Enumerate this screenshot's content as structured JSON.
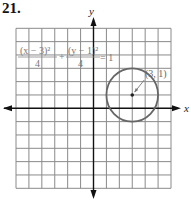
{
  "problem_number": "21.",
  "chart_data": {
    "type": "line",
    "title": "",
    "xlabel": "x",
    "ylabel": "y",
    "xlim": [
      -6,
      6
    ],
    "ylim": [
      -6,
      6
    ],
    "grid": true,
    "tick_step": 1,
    "equation": {
      "num1": "(x − 3)²",
      "den1": "4",
      "plus": "+",
      "num2": "(y − 1)²",
      "den2": "4",
      "rhs": "= 1"
    },
    "circle": {
      "center": [
        3,
        1
      ],
      "radius": 2
    },
    "annotations": [
      {
        "text": "(3, 1)",
        "points_to": [
          3,
          1
        ]
      }
    ]
  }
}
